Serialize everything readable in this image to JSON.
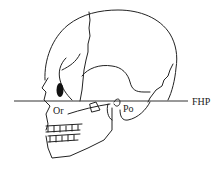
{
  "figure": {
    "labels": {
      "orbitale": "Or",
      "porion": "Po",
      "plane": "FHP"
    },
    "colors": {
      "line": "#222222",
      "background": "#ffffff"
    }
  }
}
